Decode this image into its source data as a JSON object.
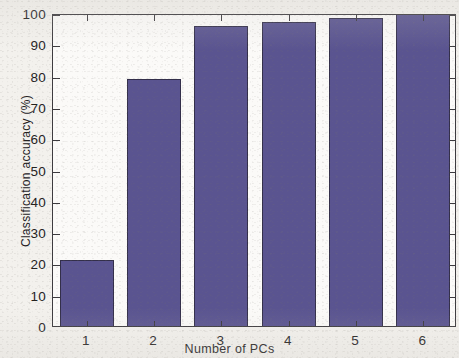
{
  "chart_data": {
    "type": "bar",
    "title": "",
    "subtitle": "",
    "xlabel": "Number of PCs",
    "ylabel": "Classification accuracy (%)",
    "categories": [
      "1",
      "2",
      "3",
      "4",
      "5",
      "6"
    ],
    "values": [
      21,
      79,
      96,
      97,
      98.5,
      100
    ],
    "series": [
      {
        "name": "Classification accuracy",
        "values": [
          21,
          79,
          96,
          97,
          98.5,
          100
        ]
      }
    ],
    "ylim": [
      0,
      100
    ],
    "xlim": [
      0.5,
      6.5
    ],
    "ytick_labels": [
      "0",
      "10",
      "20",
      "30",
      "40",
      "50",
      "60",
      "70",
      "80",
      "90",
      "100"
    ],
    "ytick_values": [
      0,
      10,
      20,
      30,
      40,
      50,
      60,
      70,
      80,
      90,
      100
    ],
    "xtick_labels": [
      "1",
      "2",
      "3",
      "4",
      "5",
      "6"
    ],
    "grid": false,
    "legend": null,
    "legend_position": "none",
    "annotations": [],
    "bar_color": "#5a5490",
    "bar_edge_color": "#332f4a",
    "axis_color": "#3c3a3e",
    "plot_background": "#fbfaf8",
    "figure_background": "#f3f1ed"
  }
}
